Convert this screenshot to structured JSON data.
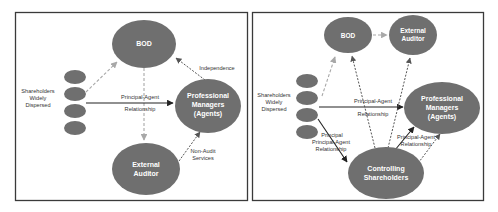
{
  "left_panel": {
    "nodes": {
      "bod": "BOD",
      "managers": [
        "Professional",
        "Managers",
        "(Agents)"
      ],
      "auditor": [
        "External",
        "Auditor"
      ],
      "shareholders_label": [
        "Shareholders",
        "Widely",
        "Dispersed"
      ]
    },
    "edges": {
      "principal_agent": [
        "Principal-Agent",
        "Relationship"
      ],
      "independence": "Independence",
      "non_audit": [
        "Non-Audit",
        "Services"
      ]
    }
  },
  "right_panel": {
    "nodes": {
      "bod": "BOD",
      "auditor": [
        "External",
        "Auditor"
      ],
      "managers": [
        "Professional",
        "Managers",
        "(Agents)"
      ],
      "controlling": [
        "Controlling",
        "Shareholders"
      ],
      "shareholders_label": [
        "Shareholders",
        "Widely",
        "Dispersed"
      ]
    },
    "edges": {
      "principal_agent_top": [
        "Principal-Agent",
        "Relationship"
      ],
      "principal_agent_left": [
        "Principal",
        "Principal-Agent",
        "Relationship"
      ],
      "principal_agent_right": [
        "Principal-Agent",
        "Relationship"
      ]
    }
  },
  "colors": {
    "node_fill": "#6f6f6f",
    "solid_arrow": "#222222",
    "dashed_light": "#a8a8a8",
    "dashed_dark": "#555555"
  }
}
